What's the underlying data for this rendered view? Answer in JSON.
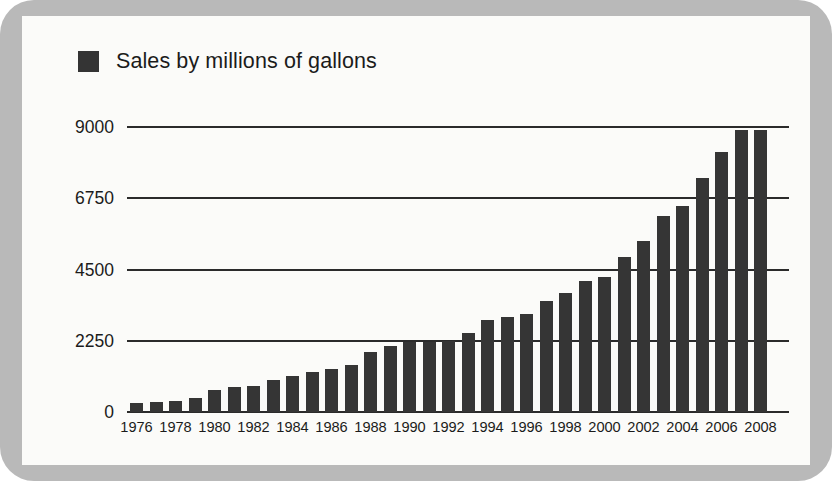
{
  "legend": {
    "swatch_name": "legend-color-swatch",
    "swatch_color": "#343434",
    "label": "Sales by millions of gallons"
  },
  "colors": {
    "frame": "#b9b9b9",
    "card_background": "#fbfbf9",
    "bar": "#353535",
    "axis": "#2b2b2b",
    "text": "#1b1b1b"
  },
  "chart_data": {
    "type": "bar",
    "title": "",
    "subtitle": "",
    "xlabel": "",
    "ylabel": "",
    "legend": [
      "Sales by millions of gallons"
    ],
    "legend_position": "top-left",
    "grid": true,
    "ylim": [
      0,
      9000
    ],
    "yticks": [
      0,
      2250,
      4500,
      6750,
      9000
    ],
    "ytick_labels": [
      "0",
      "2250",
      "4500",
      "6750",
      "9000"
    ],
    "xtick_labels": [
      "1976",
      "1978",
      "1980",
      "1982",
      "1984",
      "1986",
      "1988",
      "1990",
      "1992",
      "1994",
      "1996",
      "1998",
      "2000",
      "2002",
      "2004",
      "2006",
      "2008"
    ],
    "categories": [
      "1976",
      "1977",
      "1978",
      "1979",
      "1980",
      "1981",
      "1982",
      "1983",
      "1984",
      "1985",
      "1986",
      "1987",
      "1988",
      "1989",
      "1990",
      "1991",
      "1992",
      "1993",
      "1994",
      "1995",
      "1996",
      "1997",
      "1998",
      "1999",
      "2000",
      "2001",
      "2002",
      "2003",
      "2004",
      "2005",
      "2006",
      "2007",
      "2008"
    ],
    "values": [
      280,
      320,
      350,
      450,
      700,
      800,
      830,
      1000,
      1150,
      1250,
      1350,
      1500,
      1900,
      2100,
      2200,
      2200,
      2250,
      2500,
      2900,
      3000,
      3100,
      3500,
      3750,
      4150,
      4250,
      4900,
      5400,
      6200,
      6500,
      7400,
      8200,
      8900,
      8900
    ],
    "series": [
      {
        "name": "Sales by millions of gallons",
        "values": [
          280,
          320,
          350,
          450,
          700,
          800,
          830,
          1000,
          1150,
          1250,
          1350,
          1500,
          1900,
          2100,
          2200,
          2200,
          2250,
          2500,
          2900,
          3000,
          3100,
          3500,
          3750,
          4150,
          4250,
          4900,
          5400,
          6200,
          6500,
          7400,
          8200,
          8900,
          8900
        ]
      }
    ]
  },
  "geometry": {
    "plot_left": 105,
    "plot_right": 745,
    "plot_top": 111,
    "plot_bottom": 396,
    "bar_width": 13,
    "bar_step": 19.5
  }
}
